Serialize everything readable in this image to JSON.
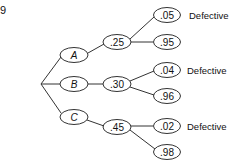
{
  "problem_number": "9",
  "tree": {
    "branches": [
      {
        "label": "A",
        "prob": ".25",
        "outcomes": [
          {
            "prob": ".05",
            "label": "Defective"
          },
          {
            "prob": ".95",
            "label": ""
          }
        ]
      },
      {
        "label": "B",
        "prob": ".30",
        "outcomes": [
          {
            "prob": ".04",
            "label": "Defective"
          },
          {
            "prob": ".96",
            "label": ""
          }
        ]
      },
      {
        "label": "C",
        "prob": ".45",
        "outcomes": [
          {
            "prob": ".02",
            "label": "Defective"
          },
          {
            "prob": ".98",
            "label": ""
          }
        ]
      }
    ]
  },
  "colors": {
    "line": "#333333",
    "text": "#111111",
    "background": "#ffffff"
  }
}
